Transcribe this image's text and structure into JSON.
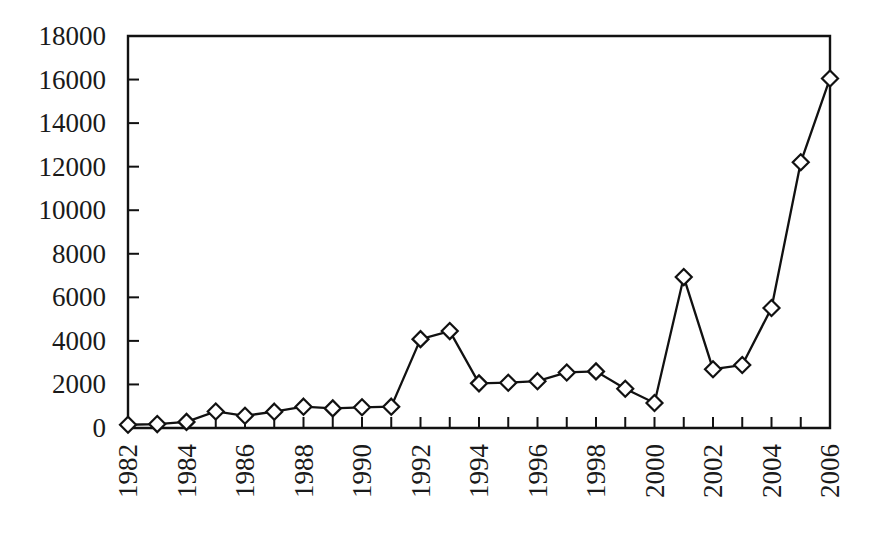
{
  "chart_data": {
    "type": "line",
    "title": "",
    "subtitle": "",
    "xlabel": "",
    "ylabel": "",
    "x": [
      1982,
      1983,
      1984,
      1985,
      1986,
      1987,
      1988,
      1989,
      1990,
      1991,
      1992,
      1993,
      1994,
      1995,
      1996,
      1997,
      1998,
      1999,
      2000,
      2001,
      2002,
      2003,
      2004,
      2005,
      2006
    ],
    "values": [
      150,
      180,
      280,
      760,
      560,
      750,
      980,
      900,
      950,
      980,
      4080,
      4450,
      2050,
      2080,
      2150,
      2550,
      2600,
      1800,
      1150,
      6930,
      2700,
      2890,
      5510,
      12200,
      16050
    ],
    "series": [
      {
        "name": "series-1",
        "marker": "diamond",
        "values": [
          150,
          180,
          280,
          760,
          560,
          750,
          980,
          900,
          950,
          980,
          4080,
          4450,
          2050,
          2080,
          2150,
          2550,
          2600,
          1800,
          1150,
          6930,
          2700,
          2890,
          5510,
          12200,
          16050
        ]
      }
    ],
    "categories": [
      "1982",
      "1983",
      "1984",
      "1985",
      "1986",
      "1987",
      "1988",
      "1989",
      "1990",
      "1991",
      "1992",
      "1993",
      "1994",
      "1995",
      "1996",
      "1997",
      "1998",
      "1999",
      "2000",
      "2001",
      "2002",
      "2003",
      "2004",
      "2005",
      "2006"
    ],
    "ylim": [
      0,
      18000
    ],
    "xlim": [
      1982,
      2006
    ],
    "ytick_values": [
      0,
      2000,
      4000,
      6000,
      8000,
      10000,
      12000,
      14000,
      16000,
      18000
    ],
    "ytick_labels": [
      "0",
      "2000",
      "4000",
      "6000",
      "8000",
      "10000",
      "12000",
      "14000",
      "16000",
      "18000"
    ],
    "xtick_values": [
      1982,
      1984,
      1986,
      1988,
      1990,
      1992,
      1994,
      1996,
      1998,
      2000,
      2002,
      2004,
      2006
    ],
    "xtick_labels": [
      "1982",
      "1984",
      "1986",
      "1988",
      "1990",
      "1992",
      "1994",
      "1996",
      "1998",
      "2000",
      "2002",
      "2004",
      "2006"
    ],
    "xtick_rotation": 90,
    "grid": false,
    "legend": false,
    "legend_position": "none",
    "annotations": [],
    "line_color": "#111111",
    "marker_fill": "#ffffff",
    "marker_edge_color": "#111111",
    "background_color": "#ffffff"
  },
  "figure": {
    "plot_left": 128,
    "plot_right": 830,
    "plot_top": 36,
    "plot_bottom": 428
  }
}
